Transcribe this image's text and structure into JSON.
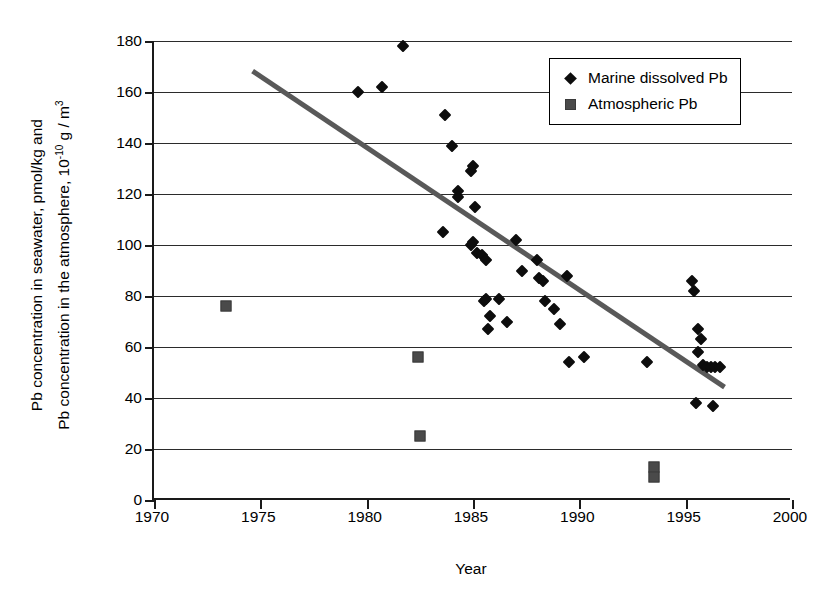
{
  "chart_data": {
    "type": "scatter",
    "title": "",
    "xlabel": "Year",
    "ylabel_line1": "Pb concentration in seawater, pmol/kg and",
    "ylabel_line2_pre": "Pb concentration in the atmosphere, 10",
    "ylabel_line2_sup": "-10",
    "ylabel_line2_post": " g / m",
    "ylabel_line2_sup2": "3",
    "xlim": [
      1970,
      2000
    ],
    "ylim": [
      0,
      180
    ],
    "xticks": [
      1970,
      1975,
      1980,
      1985,
      1990,
      1995,
      2000
    ],
    "yticks": [
      0,
      20,
      40,
      60,
      80,
      100,
      120,
      140,
      160,
      180
    ],
    "grid": "horizontal",
    "legend_position": "top-right",
    "series": [
      {
        "name": "Marine dissolved Pb",
        "marker": "diamond",
        "color": "#0d0d0d",
        "points": [
          [
            1979.6,
            160
          ],
          [
            1980.7,
            162
          ],
          [
            1981.7,
            178
          ],
          [
            1983.7,
            151
          ],
          [
            1983.6,
            105
          ],
          [
            1984.0,
            139
          ],
          [
            1984.3,
            121
          ],
          [
            1984.3,
            119
          ],
          [
            1984.9,
            129
          ],
          [
            1985.0,
            131
          ],
          [
            1985.1,
            115
          ],
          [
            1985.0,
            101
          ],
          [
            1984.9,
            100
          ],
          [
            1985.2,
            97
          ],
          [
            1985.4,
            96
          ],
          [
            1985.6,
            94
          ],
          [
            1985.5,
            78
          ],
          [
            1985.6,
            79
          ],
          [
            1985.8,
            72
          ],
          [
            1985.7,
            67
          ],
          [
            1986.2,
            79
          ],
          [
            1986.6,
            70
          ],
          [
            1987.0,
            102
          ],
          [
            1987.3,
            90
          ],
          [
            1988.0,
            94
          ],
          [
            1988.1,
            87
          ],
          [
            1988.3,
            86
          ],
          [
            1988.4,
            78
          ],
          [
            1988.8,
            75
          ],
          [
            1989.1,
            69
          ],
          [
            1989.4,
            88
          ],
          [
            1989.5,
            54
          ],
          [
            1990.2,
            56
          ],
          [
            1993.2,
            54
          ],
          [
            1995.3,
            86
          ],
          [
            1995.4,
            82
          ],
          [
            1995.6,
            67
          ],
          [
            1995.7,
            63
          ],
          [
            1995.6,
            58
          ],
          [
            1995.8,
            53
          ],
          [
            1996.0,
            52
          ],
          [
            1996.2,
            52
          ],
          [
            1996.4,
            52
          ],
          [
            1996.6,
            52
          ],
          [
            1995.5,
            38
          ],
          [
            1996.3,
            37
          ]
        ]
      },
      {
        "name": "Atmospheric Pb",
        "marker": "square",
        "color": "#4a4a4a",
        "points": [
          [
            1973.4,
            76
          ],
          [
            1982.4,
            56
          ],
          [
            1982.5,
            25
          ],
          [
            1993.5,
            13
          ],
          [
            1993.5,
            9
          ]
        ]
      }
    ],
    "trendline": {
      "x1": 1974.7,
      "y1": 169,
      "x2": 1996.9,
      "y2": 45,
      "color": "#595959"
    }
  },
  "legend": {
    "items": [
      {
        "label": "Marine dissolved Pb",
        "marker": "diamond-marker"
      },
      {
        "label": "Atmospheric Pb",
        "marker": "square-marker"
      }
    ]
  }
}
